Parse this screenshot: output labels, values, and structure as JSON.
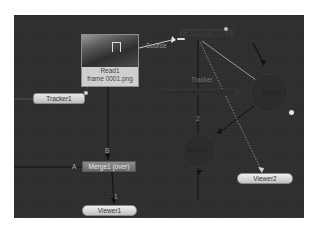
{
  "graph": {
    "nodes": {
      "read": {
        "title": "Read1",
        "subtitle": "frame 0001.png"
      },
      "tracker": {
        "label": "Tracker1"
      },
      "merge": {
        "label": "Merge1 (over)",
        "input_a": "A",
        "input_b": "B"
      },
      "viewer1": {
        "label": "Viewer1",
        "input": "1"
      },
      "viewer2": {
        "label": "Viewer2"
      },
      "camera_tracker": {
        "label": "CameraTracker1",
        "input_label": "Source"
      },
      "camera_solve": {
        "label": "CameraTrackerPointCloud1",
        "input_label": "Tracker"
      },
      "cube": {
        "label": "Cube1"
      },
      "scene": {
        "label": "Scene1",
        "input": "2"
      }
    },
    "colors": {
      "background": "#2f2f2f",
      "node_fill": "#d0d0d0",
      "merge_fill": "#7a7a7a",
      "wire": "#111111",
      "highlight_wire": "#bfbfbf"
    }
  }
}
